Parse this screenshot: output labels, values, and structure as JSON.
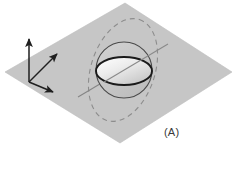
{
  "figure": {
    "panel_label": "(A)",
    "caption_label": "(A)",
    "background_color": "#ffffff",
    "plane": {
      "name": "equatorial-plane",
      "fill_color": "#c6c6c6",
      "edge_color": "#b4b4b4",
      "vertices": [
        {
          "x": 125,
          "y": 3
        },
        {
          "x": 232,
          "y": 72
        },
        {
          "x": 120,
          "y": 143
        },
        {
          "x": 5,
          "y": 72
        }
      ]
    },
    "axes": {
      "name": "coordinate-axes",
      "color": "#1f1f1f",
      "origin": {
        "x": 29,
        "y": 82
      },
      "arrows": [
        {
          "label": "z-axis",
          "tip": {
            "x": 29,
            "y": 36
          }
        },
        {
          "label": "x-axis",
          "tip": {
            "x": 60,
            "y": 52
          }
        },
        {
          "label": "y-axis",
          "tip": {
            "x": 56,
            "y": 93
          }
        }
      ]
    },
    "sphere": {
      "name": "sphere-outline",
      "center": {
        "x": 124,
        "y": 70
      },
      "radius": 28,
      "stroke_color": "#4a4a4a",
      "fill_color": "#c2c2c2"
    },
    "disc": {
      "name": "tilted-disc",
      "center": {
        "x": 124,
        "y": 71
      },
      "semi_major": 28,
      "semi_minor": 14,
      "rotation_deg": 0,
      "stroke_color": "#1a1a1a",
      "stroke_width": 1.8,
      "fill_from": "#f3f3f3",
      "fill_to": "#c9c9c9"
    },
    "dashed_ellipse": {
      "name": "dashed-orbit-ellipse",
      "center": {
        "x": 123,
        "y": 70
      },
      "semi_major": 53,
      "semi_minor": 32,
      "rotation_deg": -72,
      "stroke_color": "#8d8d8d",
      "dash_pattern": "5,4"
    },
    "axis_line": {
      "name": "rotation-axis-line",
      "start": {
        "x": 78,
        "y": 97
      },
      "end": {
        "x": 168,
        "y": 44
      },
      "stroke_color": "#7f7f7f"
    }
  }
}
